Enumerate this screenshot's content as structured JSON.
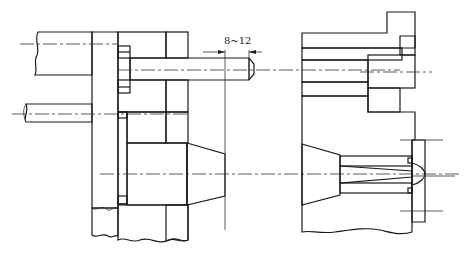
{
  "figure": {
    "type": "mechanical-section-drawing",
    "views": [
      {
        "id": "left",
        "description": "Ejector plate with ejector pin and sprue bushing cross-section (split view)"
      },
      {
        "id": "right",
        "description": "Sprue bushing seated in mold plate with nozzle seat cross-section"
      }
    ],
    "dimension": {
      "label": "8~12",
      "unit": "mm"
    },
    "colors": {
      "line": "#1a1a1a",
      "background": "#ffffff"
    }
  }
}
